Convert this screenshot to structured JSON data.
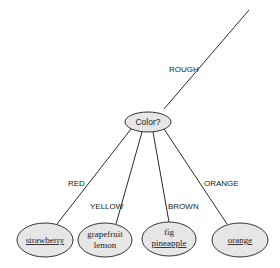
{
  "diagram": {
    "type": "decision-tree-fragment",
    "incoming_edge": {
      "label": "ROUGH"
    },
    "question_node": {
      "label": "Color?"
    },
    "branches": [
      {
        "edge_label": "RED",
        "leaf_lines": [
          {
            "text": "strawberry",
            "underlined": true
          }
        ]
      },
      {
        "edge_label": "YELLOW",
        "leaf_lines": [
          {
            "text": "grapefruit",
            "underlined": false
          },
          {
            "text": "lemon",
            "underlined": false
          }
        ]
      },
      {
        "edge_label": "BROWN",
        "leaf_lines": [
          {
            "text": "fig",
            "underlined": false
          },
          {
            "text": "pineapple",
            "underlined": true
          }
        ]
      },
      {
        "edge_label": "ORANGE",
        "leaf_lines": [
          {
            "text": "orange",
            "underlined": true
          }
        ]
      }
    ],
    "colors": {
      "node_fill": "#e6e6e6",
      "stroke": "#333333",
      "text": "#222222"
    }
  }
}
